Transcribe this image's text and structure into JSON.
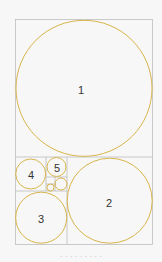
{
  "diagram": {
    "colors": {
      "frame": "#bdbdbd",
      "circle": "#d8b54a",
      "label": "#333333"
    },
    "squares": [
      {
        "id": "1",
        "label": "1"
      },
      {
        "id": "2",
        "label": "2"
      },
      {
        "id": "3",
        "label": "3"
      },
      {
        "id": "4",
        "label": "4"
      },
      {
        "id": "5",
        "label": "5"
      }
    ]
  },
  "caption": "· · · · · · · · ·"
}
